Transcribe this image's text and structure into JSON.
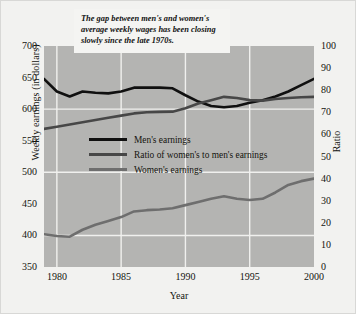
{
  "chart_data": {
    "type": "line",
    "title": "",
    "annotation": "The gap between men's and women's average weekly wages has been closing slowly since the late 1970s.",
    "xlabel": "Year",
    "ylabel": "Weekly earnings (in dollars)",
    "ylabel_right": "Ratio",
    "xlim": [
      1979,
      2000
    ],
    "ylim": [
      350,
      700
    ],
    "ylim_right": [
      0,
      100
    ],
    "grid": true,
    "legend_position": "center-left",
    "xticks": [
      "1980",
      "1985",
      "1990",
      "1995",
      "2000"
    ],
    "xtick_values": [
      1980,
      1985,
      1990,
      1995,
      2000
    ],
    "yticks_left": [
      "700",
      "650",
      "600",
      "550",
      "500",
      "450",
      "400",
      "350"
    ],
    "ytick_values_left": [
      700,
      650,
      600,
      550,
      500,
      450,
      400,
      350
    ],
    "yticks_right": [
      "100",
      "90",
      "80",
      "70",
      "60",
      "50",
      "40",
      "30",
      "20",
      "10",
      "0"
    ],
    "ytick_values_right": [
      100,
      90,
      80,
      70,
      60,
      50,
      40,
      30,
      20,
      10,
      0
    ],
    "x": [
      1979,
      1980,
      1981,
      1982,
      1983,
      1984,
      1985,
      1986,
      1987,
      1988,
      1989,
      1990,
      1991,
      1992,
      1993,
      1994,
      1995,
      1996,
      1997,
      1998,
      1999,
      2000
    ],
    "series": [
      {
        "name": "Men's earnings",
        "axis": "left",
        "color": "#101010",
        "values": [
          648,
          628,
          620,
          628,
          626,
          625,
          628,
          634,
          634,
          634,
          633,
          622,
          612,
          605,
          603,
          605,
          610,
          614,
          620,
          628,
          638,
          648
        ]
      },
      {
        "name": "Ratio of women's to men's earnings",
        "axis": "right",
        "color": "#474747",
        "values": [
          62.5,
          63.5,
          64.5,
          65.5,
          66.5,
          67.5,
          68.5,
          69.5,
          70.0,
          70.2,
          70.3,
          71.8,
          74.0,
          75.5,
          77.0,
          76.5,
          75.5,
          75.3,
          76.0,
          76.5,
          76.8,
          77.0
        ]
      },
      {
        "name": "Women's earnings",
        "axis": "left",
        "color": "#6e6e6e",
        "values": [
          402,
          399,
          398,
          409,
          417,
          423,
          429,
          438,
          440,
          441,
          443,
          448,
          453,
          458,
          462,
          458,
          456,
          458,
          468,
          480,
          486,
          490
        ]
      }
    ]
  },
  "legend": {
    "items": [
      {
        "label": "Men's earnings",
        "color": "#101010"
      },
      {
        "label": "Ratio of women's to men's earnings",
        "color": "#474747"
      },
      {
        "label": "Women's earnings",
        "color": "#6e6e6e"
      }
    ]
  },
  "colors": {
    "plot_background": "#b4b4b2",
    "figure_background": "#f2f2f0",
    "gridline": "#f0f0ee",
    "callout_background": "#f4f4f2",
    "text": "#14140f"
  }
}
